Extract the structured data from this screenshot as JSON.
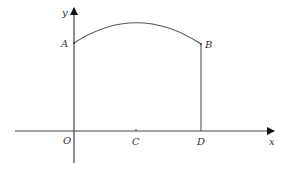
{
  "diagram": {
    "type": "coordinate-geometry",
    "colors": {
      "stroke": "#444444",
      "text": "#333333",
      "background": "#ffffff"
    },
    "axes": {
      "x_label": "x",
      "y_label": "y"
    },
    "points": {
      "A": {
        "label": "A"
      },
      "B": {
        "label": "B"
      },
      "O": {
        "label": "O"
      },
      "C": {
        "label": "C"
      },
      "D": {
        "label": "D"
      }
    }
  }
}
